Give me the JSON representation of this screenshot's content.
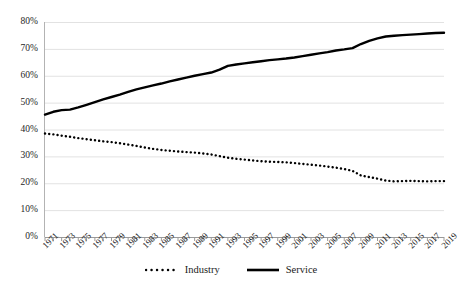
{
  "chart_data": {
    "type": "line",
    "title": "",
    "xlabel": "",
    "ylabel": "",
    "ylim": [
      0,
      0.8
    ],
    "ytick_labels": [
      "0%",
      "10%",
      "20%",
      "30%",
      "40%",
      "50%",
      "60%",
      "70%",
      "80%"
    ],
    "ytick_values": [
      0,
      10,
      20,
      30,
      40,
      50,
      60,
      70,
      80
    ],
    "grid": true,
    "grid_axis": "y",
    "legend_position": "bottom-center",
    "x": [
      1971,
      1972,
      1973,
      1974,
      1975,
      1976,
      1977,
      1978,
      1979,
      1980,
      1981,
      1982,
      1983,
      1984,
      1985,
      1986,
      1987,
      1988,
      1989,
      1990,
      1991,
      1992,
      1993,
      1994,
      1995,
      1996,
      1997,
      1998,
      1999,
      2000,
      2001,
      2002,
      2003,
      2004,
      2005,
      2006,
      2007,
      2008,
      2009,
      2010,
      2011,
      2012,
      2013,
      2014,
      2015,
      2016,
      2017,
      2018,
      2019
    ],
    "xtick_labels": [
      "1971",
      "1973",
      "1975",
      "1977",
      "1979",
      "1981",
      "1983",
      "1985",
      "1987",
      "1989",
      "1991",
      "1993",
      "1995",
      "1997",
      "1999",
      "2001",
      "2003",
      "2005",
      "2007",
      "2009",
      "2011",
      "2013",
      "2015",
      "2017",
      "2019"
    ],
    "series": [
      {
        "name": "Industry",
        "style": "dotted",
        "color": "#000000",
        "values": [
          38.5,
          38.2,
          37.7,
          37.3,
          36.8,
          36.4,
          36.0,
          35.6,
          35.3,
          34.9,
          34.4,
          33.9,
          33.3,
          32.8,
          32.4,
          32.1,
          31.8,
          31.6,
          31.4,
          31.1,
          30.7,
          30.1,
          29.5,
          29.1,
          28.8,
          28.5,
          28.2,
          28.0,
          27.9,
          27.8,
          27.5,
          27.2,
          26.9,
          26.6,
          26.2,
          25.8,
          25.3,
          24.6,
          22.9,
          22.3,
          21.7,
          21.0,
          20.7,
          20.8,
          20.9,
          20.8,
          20.7,
          20.8,
          20.8
        ]
      },
      {
        "name": "Service",
        "style": "solid",
        "color": "#000000",
        "values": [
          45.5,
          46.6,
          47.2,
          47.4,
          48.2,
          49.2,
          50.2,
          51.2,
          52.1,
          53.0,
          54.0,
          54.9,
          55.7,
          56.4,
          57.1,
          57.9,
          58.6,
          59.3,
          60.0,
          60.6,
          61.2,
          62.3,
          63.7,
          64.2,
          64.6,
          65.0,
          65.4,
          65.8,
          66.1,
          66.4,
          66.8,
          67.3,
          67.8,
          68.3,
          68.8,
          69.4,
          69.8,
          70.3,
          71.8,
          73.0,
          73.9,
          74.6,
          74.9,
          75.1,
          75.3,
          75.5,
          75.7,
          75.9,
          76.0
        ]
      }
    ]
  },
  "legend": {
    "entries": [
      {
        "label": "Industry",
        "style": "dotted"
      },
      {
        "label": "Service",
        "style": "solid"
      }
    ]
  }
}
